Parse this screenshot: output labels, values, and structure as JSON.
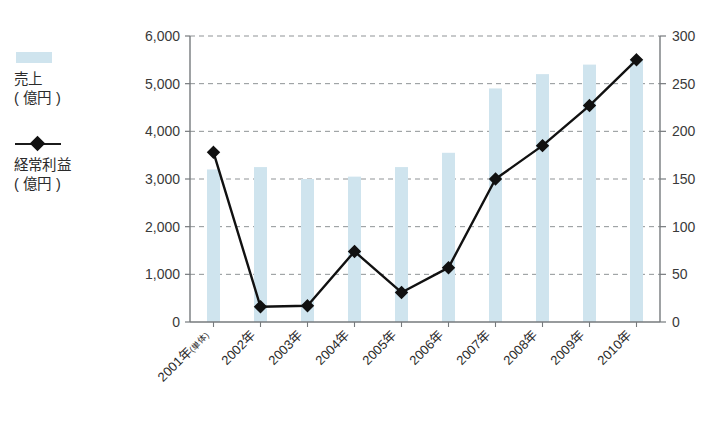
{
  "legend": {
    "series": [
      {
        "name": "sales",
        "label": "売上\n( 億円 )",
        "marker": "bar-swatch",
        "color": "#cfe4ee"
      },
      {
        "name": "ordinary_profit",
        "label": "経常利益\n( 億円 )",
        "marker": "diamond-line",
        "color": "#111111"
      }
    ]
  },
  "chart_data": {
    "type": "bar",
    "title": "",
    "xlabel": "",
    "ylabel": "",
    "grid": true,
    "legend_position": "left",
    "categories": [
      "2001年(単体)",
      "2002年",
      "2003年",
      "2004年",
      "2005年",
      "2006年",
      "2007年",
      "2008年",
      "2009年",
      "2010年"
    ],
    "category_main": [
      "2001年",
      "2002年",
      "2003年",
      "2004年",
      "2005年",
      "2006年",
      "2007年",
      "2008年",
      "2009年",
      "2010年"
    ],
    "category_sub": [
      "(単体)",
      "",
      "",
      "",
      "",
      "",
      "",
      "",
      "",
      ""
    ],
    "axes": {
      "left": {
        "label": "売上 ( 億円 )",
        "min": 0,
        "max": 6000,
        "step": 1000,
        "ticks": [
          "0",
          "1,000",
          "2,000",
          "3,000",
          "4,000",
          "5,000",
          "6,000"
        ],
        "tick_values": [
          0,
          1000,
          2000,
          3000,
          4000,
          5000,
          6000
        ]
      },
      "right": {
        "label": "経常利益 ( 億円 )",
        "min": 0,
        "max": 300,
        "step": 50,
        "ticks": [
          "0",
          "50",
          "100",
          "150",
          "200",
          "250",
          "300"
        ],
        "tick_values": [
          0,
          50,
          100,
          150,
          200,
          250,
          300
        ]
      }
    },
    "series": [
      {
        "name": "売上 ( 億円 )",
        "key": "sales",
        "type": "bar",
        "axis": "left",
        "color": "#cfe4ee",
        "values": [
          3200,
          3250,
          3000,
          3050,
          3250,
          3550,
          4900,
          5200,
          5400,
          5500
        ]
      },
      {
        "name": "経常利益 ( 億円 )",
        "key": "ordinary_profit",
        "type": "line",
        "axis": "right",
        "color": "#111111",
        "marker": "diamond",
        "values": [
          178,
          16,
          17,
          74,
          31,
          57,
          150,
          185,
          227,
          275
        ]
      }
    ]
  }
}
